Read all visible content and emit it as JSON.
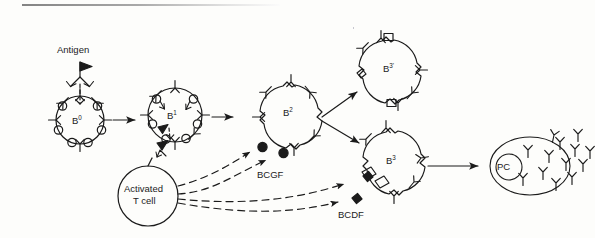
{
  "diagram": {
    "background_color": "#fdfdfb",
    "stroke_color": "#1b1b1b",
    "labels": {
      "antigen": "Antigen",
      "b0": "B",
      "b0_sup": "0",
      "b1": "B",
      "b1_sup": "1",
      "b2": "B",
      "b2_sup": "2",
      "b3prime": "B",
      "b3prime_sup": "3'",
      "b3": "B",
      "b3_sup": "3",
      "t_cell_line1": "Activated",
      "t_cell_line2": "T cell",
      "plasma_cell": "PC",
      "bcgf": "BCGF",
      "bcdf": "BCDF"
    },
    "cells": [
      {
        "id": "b0",
        "label": "B0",
        "role": "resting-b-cell",
        "receptors": "surface immunoglobulin (Y) and round knobs"
      },
      {
        "id": "b1",
        "label": "B1",
        "role": "antigen-activated-b-cell",
        "receptors": "surface immunoglobulin (Y) and round knobs"
      },
      {
        "id": "b2",
        "label": "B2",
        "role": "bcgf-responsive-b-cell",
        "receptors": "surface immunoglobulin (Y) and BCGF receptors"
      },
      {
        "id": "b3prime",
        "label": "B3'",
        "role": "proliferated-b-cell",
        "receptors": "surface immunoglobulin (Y) and square receptors"
      },
      {
        "id": "b3",
        "label": "B3",
        "role": "bcdf-responsive-b-cell",
        "receptors": "surface immunoglobulin (Y) and BCDF receptors"
      },
      {
        "id": "tcell",
        "label": "Activated T cell",
        "role": "helper-t-cell",
        "receptors": "none"
      },
      {
        "id": "plasma",
        "label": "PC",
        "role": "plasma-cell",
        "receptors": "secreted antibody"
      }
    ],
    "factors": [
      {
        "name": "BCGF",
        "marker": "filled-circle",
        "source": "Activated T cell",
        "target": "B2",
        "count": 2
      },
      {
        "name": "BCDF",
        "marker": "filled-diamond",
        "source": "Activated T cell",
        "target": "B3",
        "count": 2
      }
    ],
    "flow": [
      {
        "from": "Antigen",
        "to": "B0",
        "style": "solid"
      },
      {
        "from": "B0",
        "to": "B1",
        "style": "solid"
      },
      {
        "from": "B1",
        "to": "B2",
        "style": "solid"
      },
      {
        "from": "B2",
        "to": "B3'",
        "style": "solid"
      },
      {
        "from": "B2",
        "to": "B3",
        "style": "solid"
      },
      {
        "from": "B3",
        "to": "PC",
        "style": "solid"
      },
      {
        "from": "Activated T cell",
        "to": "BCGF receptors on B2",
        "style": "dashed"
      },
      {
        "from": "Activated T cell",
        "to": "BCDF receptors on B3",
        "style": "dashed"
      }
    ]
  }
}
